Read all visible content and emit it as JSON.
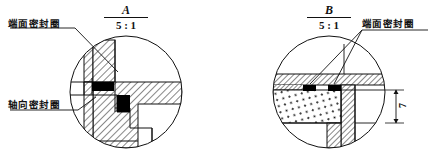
{
  "drawing": {
    "type": "engineering-detail-views",
    "background_color": "#ffffff",
    "line_color": "#111111",
    "seal_fill_color": "#000000",
    "views": [
      {
        "id": "A",
        "title_letter": "A",
        "title_scale": "5 : 1",
        "circle": {
          "cx": 126,
          "cy": 92,
          "r": 56
        },
        "callouts": [
          {
            "name": "face-seal-ring",
            "label": "端面密封圈",
            "x": 8,
            "y": 19
          },
          {
            "name": "axial-seal-ring",
            "label": "轴向密封圈",
            "x": 8,
            "y": 100
          }
        ],
        "seals": [
          {
            "name": "face-seal",
            "x": 92,
            "y": 82,
            "w": 22,
            "h": 9
          },
          {
            "name": "axial-seal",
            "x": 117,
            "y": 95,
            "w": 13,
            "h": 17
          }
        ],
        "hatch": "45-deg-section-lines"
      },
      {
        "id": "B",
        "title_letter": "B",
        "title_scale": "5 : 1",
        "circle": {
          "cx": 329,
          "cy": 92,
          "r": 56
        },
        "callouts": [
          {
            "name": "face-seal-ring",
            "label": "端面密封圈",
            "x": 362,
            "y": 19
          }
        ],
        "seals": [
          {
            "name": "face-seal-left",
            "x": 303,
            "y": 85,
            "w": 13,
            "h": 6
          },
          {
            "name": "face-seal-right",
            "x": 328,
            "y": 85,
            "w": 13,
            "h": 6
          }
        ],
        "dimensions": [
          {
            "name": "gap-height",
            "value": "7",
            "x": 402,
            "y": 106
          }
        ],
        "hatch": "45-deg-section-lines",
        "stipple": "dotted-elastomer-fill"
      }
    ]
  }
}
